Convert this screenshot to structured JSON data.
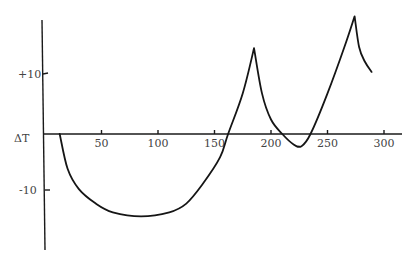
{
  "chart_data": {
    "type": "line",
    "title": "",
    "xlabel": "",
    "ylabel": "ΔT",
    "xlim": [
      0,
      315
    ],
    "ylim": [
      -20,
      20
    ],
    "grid": false,
    "legend": null,
    "x_ticks": [
      50,
      100,
      150,
      200,
      250,
      300
    ],
    "x_tick_labels": [
      "50",
      "100",
      "150",
      "200",
      "250",
      "300"
    ],
    "y_ticks": [
      10,
      -10
    ],
    "y_tick_labels": [
      "+10",
      "-10"
    ],
    "series": [
      {
        "name": "ΔT",
        "x": [
          13,
          20,
          30,
          45,
          60,
          85,
          110,
          125,
          140,
          155,
          162,
          175,
          185,
          192,
          200,
          210,
          220,
          227,
          235,
          250,
          265,
          274,
          278,
          283,
          289
        ],
        "y": [
          0,
          -6,
          -9.5,
          -12,
          -13.5,
          -14.2,
          -13.5,
          -12,
          -8.5,
          -4,
          0,
          7,
          14.8,
          7,
          2.5,
          0,
          -1.8,
          -2.1,
          0,
          7,
          15,
          20.3,
          15,
          12.5,
          10.7
        ]
      }
    ]
  },
  "axis": {
    "ylabel": "ΔT",
    "y_plus10": "+10",
    "y_minus10": "-10",
    "x_labels": [
      "50",
      "100",
      "150",
      "200",
      "250",
      "300"
    ]
  }
}
